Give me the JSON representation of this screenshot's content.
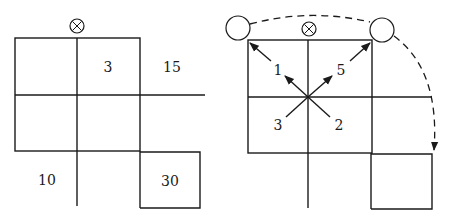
{
  "left_panel": {
    "marker_symbol": "⊗",
    "cell_labels": {
      "top_middle": "3",
      "top_right": "15",
      "bottom_left": "10",
      "bottom_right": "30"
    }
  },
  "right_panel": {
    "marker_symbol": "⊗",
    "arrow_labels": {
      "upper_left": "1",
      "upper_right": "5",
      "lower_left": "3",
      "lower_right": "2"
    }
  },
  "colors": {
    "stroke": "#1a1a1a",
    "background": "#ffffff"
  }
}
